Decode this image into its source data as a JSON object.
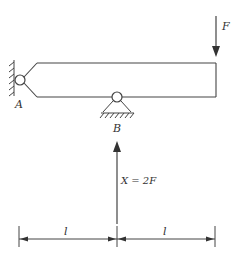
{
  "diagram": {
    "type": "beam-statics",
    "labels": {
      "support_a": "A",
      "support_b": "B",
      "force_top": "F",
      "reaction": "X = 2F",
      "span_left": "l",
      "span_right": "l"
    },
    "colors": {
      "stroke": "#444444",
      "background": "#ffffff"
    }
  }
}
